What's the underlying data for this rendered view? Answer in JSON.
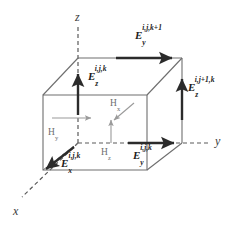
{
  "figure": {
    "width": 233,
    "height": 231,
    "background": "#ffffff",
    "colors": {
      "cube_edge": "#6e6e6e",
      "axis_dashed": "#5a5a5a",
      "e_arrow": "#2b2b2b",
      "h_arrow": "#9a9a9a",
      "e_label": "#1c1c1c",
      "h_label": "#6e6e6e",
      "axis_label": "#3a3a3a"
    }
  },
  "axes": [
    {
      "name": "z-axis-label",
      "label": "z",
      "x": 75,
      "y": 11,
      "style": "dashed-vertical"
    },
    {
      "name": "y-axis-label",
      "label": "y",
      "x": 215,
      "y": 135,
      "style": "dashed-horizontal"
    },
    {
      "name": "x-axis-label",
      "label": "x",
      "x": 13,
      "y": 205,
      "style": "dashed-diagonal"
    }
  ],
  "e_fields": [
    {
      "name": "e-y-top",
      "symbol": "E",
      "sub": "y",
      "sup": "i,j,k+1",
      "text": "E_y^{i,j,k+1}",
      "label_x": 135,
      "label_y": 30,
      "arrow": {
        "x1": 116,
        "y1": 58,
        "x2": 176,
        "y2": 58,
        "dir": "right"
      }
    },
    {
      "name": "e-z-front",
      "symbol": "E",
      "sub": "z",
      "sup": "i,j,k",
      "text": "E_z^{i,j,k}",
      "label_x": 88,
      "label_y": 71,
      "arrow": {
        "x1": 78,
        "y1": 115,
        "x2": 78,
        "y2": 71,
        "dir": "up"
      }
    },
    {
      "name": "e-z-right",
      "symbol": "E",
      "sub": "z",
      "sup": "i,j+1,k",
      "text": "E_z^{i,j+1,k}",
      "label_x": 188,
      "label_y": 82,
      "arrow": {
        "x1": 182,
        "y1": 120,
        "x2": 182,
        "y2": 76,
        "dir": "up"
      }
    },
    {
      "name": "e-y-front",
      "symbol": "E",
      "sub": "y",
      "sup": "i,j,k",
      "text": "E_y^{i,j,k}",
      "label_x": 133,
      "label_y": 150,
      "arrow": {
        "x1": 128,
        "y1": 143,
        "x2": 178,
        "y2": 143,
        "dir": "right"
      }
    },
    {
      "name": "e-x-front",
      "symbol": "E",
      "sub": "x",
      "sup": "i,j,k",
      "text": "E_x^{i,j,k}",
      "label_x": 61,
      "label_y": 158,
      "arrow": {
        "x1": 74,
        "y1": 147,
        "x2": 43,
        "y2": 172,
        "dir": "down-left"
      }
    }
  ],
  "h_fields": [
    {
      "name": "h-x",
      "symbol": "H",
      "sub": "x",
      "text": "Hx",
      "label_x": 110,
      "label_y": 99,
      "arrow": {
        "x1": 134,
        "y1": 103,
        "x2": 112,
        "y2": 122,
        "dir": "down-left"
      }
    },
    {
      "name": "h-y",
      "symbol": "H",
      "sub": "y",
      "text": "Hy",
      "label_x": 48,
      "label_y": 128,
      "arrow": {
        "x1": 52,
        "y1": 118,
        "x2": 93,
        "y2": 118,
        "dir": "right"
      }
    },
    {
      "name": "h-z",
      "symbol": "H",
      "sub": "z",
      "text": "Hz",
      "label_x": 101,
      "label_y": 148,
      "arrow": {
        "x1": 111,
        "y1": 143,
        "x2": 111,
        "y2": 118,
        "dir": "up"
      }
    }
  ]
}
